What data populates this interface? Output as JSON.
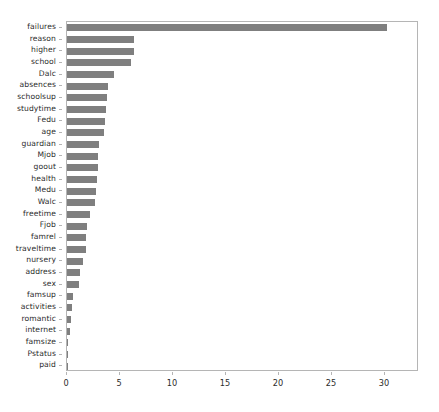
{
  "chart_data": {
    "type": "bar",
    "orientation": "horizontal",
    "title": "",
    "xlabel": "",
    "ylabel": "",
    "xlim": [
      0,
      33.2
    ],
    "xticks": [
      0,
      5,
      10,
      15,
      20,
      25,
      30
    ],
    "xtick_labels": [
      "0",
      "5",
      "10",
      "15",
      "20",
      "25",
      "30"
    ],
    "grid": false,
    "legend": false,
    "bar_color": "#7f7f7f",
    "axes_color": "#b5b5b5",
    "background_color": "#ffffff",
    "categories": [
      "failures",
      "reason",
      "higher",
      "school",
      "Dalc",
      "absences",
      "schoolsup",
      "studytime",
      "Fedu",
      "age",
      "guardian",
      "Mjob",
      "goout",
      "health",
      "Medu",
      "Walc",
      "freetime",
      "Fjob",
      "famrel",
      "traveltime",
      "nursery",
      "address",
      "sex",
      "famsup",
      "activities",
      "romantic",
      "internet",
      "famsize",
      "Pstatus",
      "paid"
    ],
    "values": [
      30.2,
      6.3,
      6.3,
      6.0,
      4.4,
      3.9,
      3.8,
      3.7,
      3.6,
      3.5,
      3.0,
      2.9,
      2.9,
      2.8,
      2.7,
      2.6,
      2.2,
      1.9,
      1.8,
      1.8,
      1.5,
      1.2,
      1.1,
      0.6,
      0.5,
      0.4,
      0.3,
      0.1,
      0.05,
      0.03
    ]
  }
}
